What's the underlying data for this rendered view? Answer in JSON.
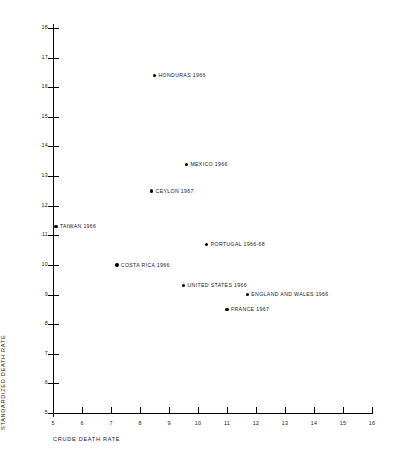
{
  "chart_data": {
    "type": "scatter",
    "title": "",
    "xlabel": "CRUDE DEATH RATE",
    "ylabel": "STANDARDIZED DEATH RATE",
    "xlim": [
      5,
      16
    ],
    "ylim": [
      5,
      18
    ],
    "xticks": [
      "5",
      "6",
      "7",
      "8",
      "9",
      "10",
      "11",
      "12",
      "13",
      "14",
      "15",
      "16"
    ],
    "yticks": [
      "18",
      "17",
      "16",
      "15",
      "14",
      "13",
      "12",
      "11",
      "10",
      "9",
      "8",
      "7",
      "6",
      "5"
    ],
    "grid": false,
    "legend": "none",
    "marker_color": "#000000",
    "points": [
      {
        "label": "HONDURAS 1966",
        "x": 8.5,
        "y": 16.4
      },
      {
        "label": "MEXICO 1966",
        "x": 9.6,
        "y": 13.4
      },
      {
        "label": "CEYLON 1967",
        "x": 8.4,
        "y": 12.5
      },
      {
        "label": "TAIWAN 1966",
        "x": 5.1,
        "y": 11.3
      },
      {
        "label": "PORTUGAL 1966-68",
        "x": 10.3,
        "y": 10.7
      },
      {
        "label": "COSTA RICA 1966",
        "x": 7.2,
        "y": 10.0
      },
      {
        "label": "UNITED STATES 1966",
        "x": 9.5,
        "y": 9.3
      },
      {
        "label": "ENGLAND AND WALES 1966",
        "x": 11.7,
        "y": 9.0
      },
      {
        "label": "FRANCE 1967",
        "x": 11.0,
        "y": 8.5
      }
    ]
  }
}
